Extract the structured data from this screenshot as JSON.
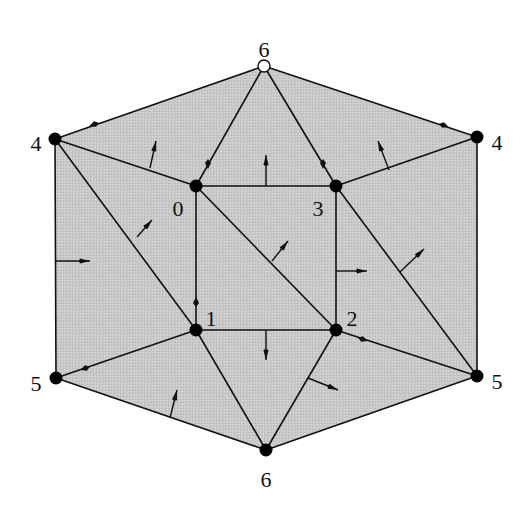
{
  "diagram": {
    "type": "triangulated-hexagon-with-normals",
    "fill_color": "#c8c8c8",
    "vertices": [
      {
        "id": "v6-top",
        "label": "6",
        "x": 264,
        "y": 66,
        "style": "open",
        "lx": 264,
        "ly": 52
      },
      {
        "id": "v4-left",
        "label": "4",
        "x": 55,
        "y": 139,
        "style": "filled",
        "lx": 36,
        "ly": 146
      },
      {
        "id": "v4-right",
        "label": "4",
        "x": 477,
        "y": 137,
        "style": "filled",
        "lx": 497,
        "ly": 145
      },
      {
        "id": "v0",
        "label": "0",
        "x": 196,
        "y": 186,
        "style": "filled",
        "lx": 178,
        "ly": 211
      },
      {
        "id": "v3",
        "label": "3",
        "x": 336,
        "y": 186,
        "style": "filled",
        "lx": 318,
        "ly": 211
      },
      {
        "id": "v1",
        "label": "1",
        "x": 196,
        "y": 330,
        "style": "filled",
        "lx": 211,
        "ly": 321
      },
      {
        "id": "v2",
        "label": "2",
        "x": 336,
        "y": 330,
        "style": "filled",
        "lx": 352,
        "ly": 321
      },
      {
        "id": "v5-left",
        "label": "5",
        "x": 56,
        "y": 378,
        "style": "filled",
        "lx": 36,
        "ly": 386
      },
      {
        "id": "v5-right",
        "label": "5",
        "x": 477,
        "y": 376,
        "style": "filled",
        "lx": 497,
        "ly": 384
      },
      {
        "id": "v6-bottom",
        "label": "6",
        "x": 266,
        "y": 450,
        "style": "filled",
        "lx": 266,
        "ly": 482
      }
    ],
    "outline": [
      [
        264,
        66
      ],
      [
        477,
        137
      ],
      [
        477,
        376
      ],
      [
        266,
        450
      ],
      [
        56,
        378
      ],
      [
        55,
        139
      ]
    ],
    "edges": [
      [
        264,
        66,
        477,
        137
      ],
      [
        477,
        137,
        477,
        376
      ],
      [
        477,
        376,
        266,
        450
      ],
      [
        266,
        450,
        56,
        378
      ],
      [
        56,
        378,
        55,
        139
      ],
      [
        55,
        139,
        264,
        66
      ],
      [
        196,
        186,
        336,
        186
      ],
      [
        336,
        186,
        336,
        330
      ],
      [
        336,
        330,
        196,
        330
      ],
      [
        196,
        330,
        196,
        186
      ],
      [
        196,
        186,
        336,
        330
      ],
      [
        264,
        66,
        196,
        186
      ],
      [
        264,
        66,
        336,
        186
      ],
      [
        55,
        139,
        196,
        186
      ],
      [
        477,
        137,
        336,
        186
      ],
      [
        55,
        139,
        196,
        330
      ],
      [
        336,
        186,
        477,
        376
      ],
      [
        56,
        378,
        196,
        330
      ],
      [
        336,
        330,
        477,
        376
      ],
      [
        196,
        330,
        266,
        450
      ],
      [
        336,
        330,
        266,
        450
      ]
    ],
    "normals": [
      {
        "x1": 150,
        "y1": 168,
        "x2": 156,
        "y2": 141
      },
      {
        "x1": 137,
        "y1": 237,
        "x2": 152,
        "y2": 220
      },
      {
        "x1": 266,
        "y1": 186,
        "x2": 266,
        "y2": 155
      },
      {
        "x1": 389,
        "y1": 170,
        "x2": 378,
        "y2": 141
      },
      {
        "x1": 55,
        "y1": 261,
        "x2": 90,
        "y2": 261
      },
      {
        "x1": 272,
        "y1": 261,
        "x2": 288,
        "y2": 241
      },
      {
        "x1": 336,
        "y1": 271,
        "x2": 367,
        "y2": 271
      },
      {
        "x1": 400,
        "y1": 272,
        "x2": 424,
        "y2": 249
      },
      {
        "x1": 266,
        "y1": 330,
        "x2": 266,
        "y2": 360
      },
      {
        "x1": 170,
        "y1": 418,
        "x2": 177,
        "y2": 390
      },
      {
        "x1": 308,
        "y1": 378,
        "x2": 338,
        "y2": 390
      }
    ],
    "edge_markers": [
      {
        "x": 95,
        "y": 124,
        "dir": "left"
      },
      {
        "x": 443,
        "y": 125,
        "dir": "right"
      },
      {
        "x": 208,
        "y": 163,
        "dir": "down"
      },
      {
        "x": 323,
        "y": 163,
        "dir": "down"
      },
      {
        "x": 196,
        "y": 303,
        "dir": "up"
      },
      {
        "x": 86,
        "y": 368,
        "dir": "left"
      },
      {
        "x": 362,
        "y": 339,
        "dir": "right"
      }
    ]
  }
}
